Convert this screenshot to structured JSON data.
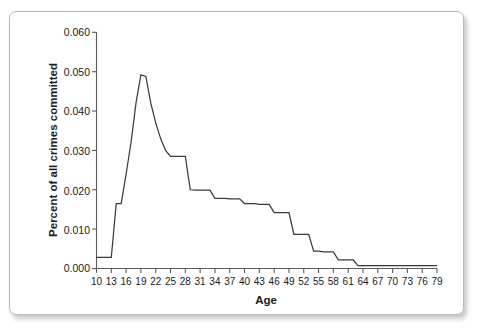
{
  "figure": {
    "background_color": "#ffffff",
    "frame_border_color": "#b9b9b9",
    "line_color": "#3a3a3a",
    "axis_color": "#5b5b5b"
  },
  "chart_data": {
    "type": "line",
    "title": "",
    "subtitle": "",
    "xlabel": "Age",
    "ylabel": "Percent of all crimes committed",
    "xlim": [
      10,
      79
    ],
    "ylim": [
      0.0,
      0.06
    ],
    "grid": false,
    "legend": null,
    "legend_position": "none",
    "y_ticks": [
      0.0,
      0.01,
      0.02,
      0.03,
      0.04,
      0.05,
      0.06
    ],
    "y_tick_labels": [
      "0.000",
      "0.010",
      "0.020",
      "0.030",
      "0.040",
      "0.050",
      "0.060"
    ],
    "x_ticks": [
      10,
      13,
      16,
      19,
      22,
      25,
      28,
      31,
      34,
      37,
      40,
      43,
      46,
      49,
      52,
      55,
      58,
      61,
      64,
      67,
      70,
      73,
      76,
      79
    ],
    "x_tick_labels": [
      "10",
      "13",
      "16",
      "19",
      "22",
      "25",
      "28",
      "31",
      "34",
      "37",
      "40",
      "43",
      "46",
      "49",
      "52",
      "55",
      "58",
      "61",
      "64",
      "67",
      "70",
      "73",
      "76",
      "79"
    ],
    "x": [
      10,
      11,
      12,
      13,
      14,
      15,
      16,
      17,
      18,
      19,
      20,
      21,
      22,
      23,
      24,
      25,
      26,
      27,
      28,
      29,
      30,
      31,
      32,
      33,
      34,
      35,
      36,
      37,
      38,
      39,
      40,
      41,
      42,
      43,
      44,
      45,
      46,
      47,
      48,
      49,
      50,
      51,
      52,
      53,
      54,
      55,
      56,
      57,
      58,
      59,
      60,
      61,
      62,
      63,
      64,
      65,
      66,
      67,
      68,
      69,
      70,
      71,
      72,
      73,
      74,
      75,
      76,
      77,
      78,
      79
    ],
    "y": [
      0.0028,
      0.0028,
      0.0028,
      0.0028,
      0.0165,
      0.0165,
      0.024,
      0.032,
      0.042,
      0.0492,
      0.0488,
      0.042,
      0.037,
      0.033,
      0.03,
      0.0285,
      0.0285,
      0.0285,
      0.0285,
      0.02,
      0.0199,
      0.0199,
      0.0199,
      0.0199,
      0.0178,
      0.0178,
      0.0178,
      0.0177,
      0.0177,
      0.0177,
      0.0165,
      0.0165,
      0.0165,
      0.0163,
      0.0163,
      0.0163,
      0.0142,
      0.0142,
      0.0142,
      0.0142,
      0.0087,
      0.0087,
      0.0087,
      0.0087,
      0.0044,
      0.0044,
      0.0042,
      0.0042,
      0.0042,
      0.0022,
      0.0022,
      0.0022,
      0.0022,
      0.0007,
      0.0007,
      0.0007,
      0.0007,
      0.0007,
      0.0007,
      0.0007,
      0.0007,
      0.0007,
      0.0007,
      0.0007,
      0.0007,
      0.0007,
      0.0007,
      0.0007,
      0.0007,
      0.0007
    ],
    "series": [
      {
        "name": "Percent of all crimes committed",
        "values": [
          0.0028,
          0.0028,
          0.0028,
          0.0028,
          0.0165,
          0.0165,
          0.024,
          0.032,
          0.042,
          0.0492,
          0.0488,
          0.042,
          0.037,
          0.033,
          0.03,
          0.0285,
          0.0285,
          0.0285,
          0.0285,
          0.02,
          0.0199,
          0.0199,
          0.0199,
          0.0199,
          0.0178,
          0.0178,
          0.0178,
          0.0177,
          0.0177,
          0.0177,
          0.0165,
          0.0165,
          0.0165,
          0.0163,
          0.0163,
          0.0163,
          0.0142,
          0.0142,
          0.0142,
          0.0142,
          0.0087,
          0.0087,
          0.0087,
          0.0087,
          0.0044,
          0.0044,
          0.0042,
          0.0042,
          0.0042,
          0.0022,
          0.0022,
          0.0022,
          0.0022,
          0.0007,
          0.0007,
          0.0007,
          0.0007,
          0.0007,
          0.0007,
          0.0007,
          0.0007,
          0.0007,
          0.0007,
          0.0007,
          0.0007,
          0.0007,
          0.0007,
          0.0007,
          0.0007,
          0.0007
        ]
      }
    ],
    "peak": {
      "age": 19,
      "value": 0.0492
    }
  }
}
